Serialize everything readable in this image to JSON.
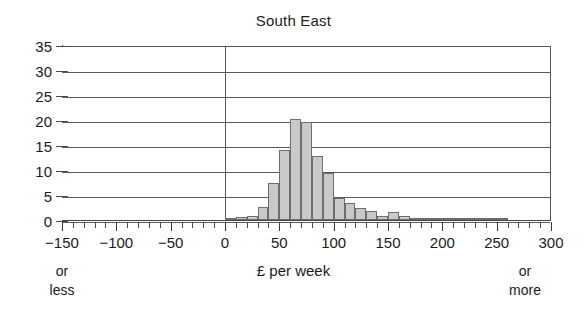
{
  "chart_data": {
    "type": "bar",
    "title": "South East",
    "xlabel": "£ per week",
    "ylabel": "",
    "xlim": [
      -150,
      300
    ],
    "ylim": [
      0,
      35
    ],
    "grid": true,
    "legend": false,
    "bin_width": 10,
    "x_tick_labels": [
      "−150",
      "−100",
      "−50",
      "0",
      "50",
      "100",
      "150",
      "200",
      "250",
      "300"
    ],
    "x_tick_values": [
      -150,
      -100,
      -50,
      0,
      50,
      100,
      150,
      200,
      250,
      300
    ],
    "x_minor_tick_step": 10,
    "y_tick_labels": [
      "0",
      "5",
      "10",
      "15",
      "20",
      "25",
      "30",
      "35"
    ],
    "y_tick_values": [
      0,
      5,
      10,
      15,
      20,
      25,
      30,
      35
    ],
    "annotations": {
      "left_axis_note": "or\nless",
      "left_axis_note_line1": "or",
      "left_axis_note_line2": "less",
      "right_axis_note_line1": "or",
      "right_axis_note_line2": "more"
    },
    "colors": {
      "bar_fill": "#c9c9c9",
      "bar_edge": "#6e6e6e",
      "grid": "#5a5a5a",
      "axis": "#4a4a4a",
      "text": "#1a1a1a",
      "background": "#ffffff"
    },
    "bins": [
      {
        "start": -150,
        "end": -140,
        "value": 0
      },
      {
        "start": -140,
        "end": -130,
        "value": 0
      },
      {
        "start": -130,
        "end": -120,
        "value": 0
      },
      {
        "start": -120,
        "end": -110,
        "value": 0
      },
      {
        "start": -110,
        "end": -100,
        "value": 0
      },
      {
        "start": -100,
        "end": -90,
        "value": 0
      },
      {
        "start": -90,
        "end": -80,
        "value": 0
      },
      {
        "start": -80,
        "end": -70,
        "value": 0
      },
      {
        "start": -70,
        "end": -60,
        "value": 0
      },
      {
        "start": -60,
        "end": -50,
        "value": 0
      },
      {
        "start": -50,
        "end": -40,
        "value": 0
      },
      {
        "start": -40,
        "end": -30,
        "value": 0
      },
      {
        "start": -30,
        "end": -20,
        "value": 0
      },
      {
        "start": -20,
        "end": -10,
        "value": 0
      },
      {
        "start": -10,
        "end": 0,
        "value": 0
      },
      {
        "start": 0,
        "end": 10,
        "value": 0.2
      },
      {
        "start": 10,
        "end": 20,
        "value": 0.6
      },
      {
        "start": 20,
        "end": 30,
        "value": 0.9
      },
      {
        "start": 30,
        "end": 40,
        "value": 2.7
      },
      {
        "start": 40,
        "end": 50,
        "value": 7.4
      },
      {
        "start": 50,
        "end": 60,
        "value": 14.1
      },
      {
        "start": 60,
        "end": 70,
        "value": 20.3
      },
      {
        "start": 70,
        "end": 80,
        "value": 19.7
      },
      {
        "start": 80,
        "end": 90,
        "value": 12.9
      },
      {
        "start": 90,
        "end": 100,
        "value": 9.5
      },
      {
        "start": 100,
        "end": 110,
        "value": 4.5
      },
      {
        "start": 110,
        "end": 120,
        "value": 3.5
      },
      {
        "start": 120,
        "end": 130,
        "value": 2.4
      },
      {
        "start": 130,
        "end": 140,
        "value": 1.8
      },
      {
        "start": 140,
        "end": 150,
        "value": 0.8
      },
      {
        "start": 150,
        "end": 160,
        "value": 1.6
      },
      {
        "start": 160,
        "end": 170,
        "value": 0.8
      },
      {
        "start": 170,
        "end": 180,
        "value": 0.4
      },
      {
        "start": 180,
        "end": 190,
        "value": 0.3
      },
      {
        "start": 190,
        "end": 200,
        "value": 0.1
      },
      {
        "start": 200,
        "end": 210,
        "value": 0.05
      },
      {
        "start": 210,
        "end": 220,
        "value": 0.05
      },
      {
        "start": 220,
        "end": 230,
        "value": 0.35
      },
      {
        "start": 230,
        "end": 240,
        "value": 0.05
      },
      {
        "start": 240,
        "end": 250,
        "value": 0.35
      },
      {
        "start": 250,
        "end": 260,
        "value": 0.05
      },
      {
        "start": 260,
        "end": 270,
        "value": 0
      },
      {
        "start": 270,
        "end": 280,
        "value": 0
      },
      {
        "start": 280,
        "end": 290,
        "value": 0
      },
      {
        "start": 290,
        "end": 300,
        "value": 0
      }
    ]
  }
}
